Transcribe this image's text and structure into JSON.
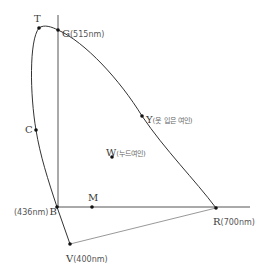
{
  "diagram": {
    "title": "",
    "points": {
      "T": {
        "letter": "T",
        "note": ""
      },
      "G": {
        "letter": "G",
        "note": "(515nm)"
      },
      "C": {
        "letter": "C",
        "note": ""
      },
      "Y": {
        "letter": "Y",
        "note": "(옷 입은 여인)"
      },
      "W": {
        "letter": "W",
        "note": "(누드여인)"
      },
      "B": {
        "letter": "B",
        "note": "(436nm)"
      },
      "M": {
        "letter": "M",
        "note": ""
      },
      "R": {
        "letter": "R",
        "note": "(700nm)"
      },
      "V": {
        "letter": "V",
        "note": "(400nm)"
      }
    },
    "colors": {
      "curve": "#333333",
      "axis": "#555555",
      "purple_line": "#999999",
      "dot": "#111111"
    }
  }
}
